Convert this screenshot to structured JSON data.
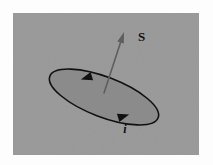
{
  "figure": {
    "panel": {
      "background_color": "#9b9b9b",
      "outer_color": "#fdfdfd",
      "x": 13,
      "y": 13,
      "width": 186,
      "height": 142
    },
    "loop": {
      "name": "current-loop",
      "fill_color": "#8b8b8b",
      "stroke_color": "#111111",
      "center_x": 104,
      "center_y": 97,
      "radius_x": 58,
      "radius_y": 20,
      "rotation_deg": 21
    },
    "normal_vector": {
      "label": "S",
      "label_x": 138,
      "label_y": 41,
      "color": "#5e5e5e",
      "tail_x": 104,
      "tail_y": 93,
      "tip_x": 124,
      "tip_y": 32
    },
    "current": {
      "label": "i",
      "label_x": 125,
      "label_y": 133,
      "direction": "clockwise-viewed-from-above",
      "arrowheads": [
        {
          "name": "current-arrowhead-top",
          "x": 89,
          "y": 77,
          "angle_deg": 163
        },
        {
          "name": "current-arrowhead-bottom",
          "x": 121,
          "y": 117,
          "angle_deg": 343
        }
      ]
    }
  }
}
